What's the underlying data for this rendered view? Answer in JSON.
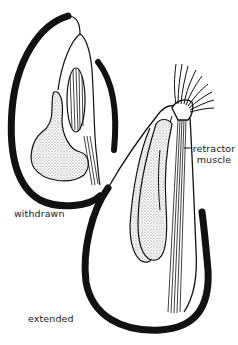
{
  "diagram": {
    "type": "biological-illustration",
    "labels": {
      "retractor_line1": "retractor",
      "retractor_line2": "muscle",
      "withdrawn": "withdrawn",
      "extended": "extended"
    },
    "colors": {
      "ink": "#111111",
      "stipple": "#c9c9c9",
      "background": "#ffffff"
    }
  }
}
